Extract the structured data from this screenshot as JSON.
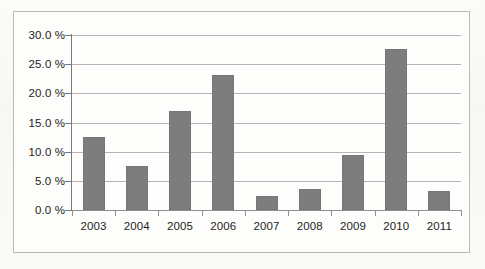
{
  "chart_data": {
    "type": "bar",
    "title": "",
    "subtitle": "",
    "xlabel": "",
    "ylabel": "",
    "categories": [
      "2003",
      "2004",
      "2005",
      "2006",
      "2007",
      "2008",
      "2009",
      "2010",
      "2011"
    ],
    "values": [
      12.5,
      7.5,
      17.0,
      23.1,
      2.4,
      3.6,
      9.4,
      27.6,
      3.3
    ],
    "series": [
      {
        "name": "",
        "values": [
          12.5,
          7.5,
          17.0,
          23.1,
          2.4,
          3.6,
          9.4,
          27.6,
          3.3
        ]
      }
    ],
    "ylim": [
      0,
      30
    ],
    "ytick_values": [
      0,
      5,
      10,
      15,
      20,
      25,
      30
    ],
    "ytick_labels": [
      "0.0 %",
      "5.0 %",
      "10.0 %",
      "15.0 %",
      "20.0 %",
      "25.0 %",
      "30.0 %"
    ],
    "xtick_labels": [
      "2003",
      "2004",
      "2005",
      "2006",
      "2007",
      "2008",
      "2009",
      "2010",
      "2011"
    ],
    "grid": true,
    "grid_axis": "y",
    "legend": false,
    "legend_position": "none",
    "annotations": [],
    "bar_color": "#7d7d7d",
    "gridline_color": "#b5b5b5",
    "axis_color": "#7a7a7a",
    "frame_color": "#b9b9b9",
    "background_color": "#fdfdfb",
    "text_color": "#1d1d1d"
  }
}
